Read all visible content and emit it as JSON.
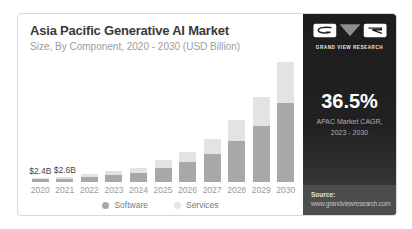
{
  "header": {
    "title": "Asia Pacific Generative AI Market",
    "subtitle": "Size, By Component, 2020 - 2030 (USD Billion)"
  },
  "sidebar": {
    "brand_name": "GRAND VIEW RESEARCH",
    "stat_value": "36.5%",
    "stat_label_line1": "APAC Market CAGR,",
    "stat_label_line2": "2023 - 2030",
    "source_label": "Source:",
    "source_url": "www.grandviewresearch.com",
    "background_color": "#1d1d1d",
    "footer_background_color": "#4d4d4d",
    "logo_triangle_color": "#8d8d8d"
  },
  "chart_data": {
    "type": "bar",
    "stacked": true,
    "title": "Asia Pacific Generative AI Market",
    "subtitle": "Size, By Component, 2020 - 2030 (USD Billion)",
    "unit": "USD Billion",
    "xlabel": "",
    "ylabel": "Market size (USD Billion)",
    "ylim": [
      0,
      68
    ],
    "grid": false,
    "legend_position": "bottom",
    "categories": [
      "2020",
      "2021",
      "2022",
      "2023",
      "2024",
      "2025",
      "2026",
      "2027",
      "2028",
      "2029",
      "2030"
    ],
    "series": [
      {
        "name": "Software",
        "color": "#a8a8a8",
        "values": [
          1.6,
          1.8,
          2.8,
          3.7,
          4.9,
          7.7,
          10.5,
          15.0,
          21.7,
          29.8,
          42.3
        ]
      },
      {
        "name": "Services",
        "color": "#e3e3e3",
        "values": [
          0.8,
          0.8,
          1.4,
          1.9,
          2.5,
          4.0,
          5.4,
          7.8,
          11.2,
          15.3,
          21.8
        ]
      }
    ],
    "totals": [
      2.4,
      2.6,
      4.2,
      5.6,
      7.4,
      11.7,
      15.9,
      22.8,
      32.9,
      45.1,
      64.1
    ],
    "value_labels": [
      "$2.4B",
      "$2.6B",
      "",
      "",
      "",
      "",
      "",
      "",
      "",
      "",
      ""
    ],
    "px_per_unit": 1.88
  }
}
